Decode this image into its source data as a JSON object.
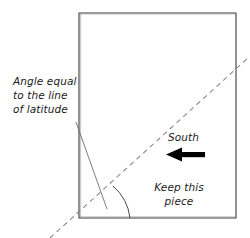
{
  "diagram": {
    "colors": {
      "outline": "#3a3a3a",
      "dashed_line": "#8c8c8c",
      "leader_line": "#6e6e6e",
      "arc": "#4a4a4a",
      "arrow": "#000000",
      "text": "#1a1a1a",
      "background": "#ffffff"
    },
    "labels": {
      "angle_note": {
        "lines": [
          "Angle equal",
          "to the line",
          "of latitude"
        ],
        "text": "Angle equal\nto the line\nof latitude"
      },
      "direction": "South",
      "keep_note": {
        "lines": [
          "Keep this",
          "piece"
        ],
        "text": "Keep this\npiece"
      }
    },
    "shapes": {
      "sheet_rectangle": {
        "x": 79,
        "y": 13,
        "width": 157,
        "height": 205
      },
      "fold_line": {
        "type": "dashed",
        "from": [
          50,
          238
        ],
        "to": [
          249,
          57
        ]
      },
      "angle_arc": {
        "from": [
          113,
          186
        ],
        "to": [
          130,
          218
        ],
        "vertex": [
          79,
          218
        ]
      },
      "leader_line": {
        "from": [
          76,
          122
        ],
        "to": [
          107,
          209
        ]
      },
      "direction_arrow": {
        "points_to": "left",
        "from": [
          205,
          155
        ],
        "to": [
          166,
          155
        ]
      }
    }
  }
}
